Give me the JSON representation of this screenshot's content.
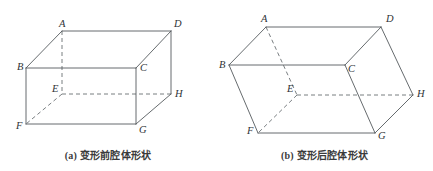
{
  "figure": {
    "background_color": "#ffffff",
    "line_color": "#555a5e",
    "hidden_line_color": "#6a6f73",
    "label_color": "#2f3336",
    "panels": [
      {
        "id": "panel-a",
        "caption": "(a) 变形前腔体形状",
        "caption_prefix": "(a)",
        "caption_text": "变形前腔体形状",
        "shape_name": "rectangular-cuboid-undeformed",
        "vertices": [
          {
            "label": "A",
            "x": 62,
            "y": 31,
            "label_x": 59,
            "label_y": 27,
            "hidden": false
          },
          {
            "label": "B",
            "x": 26,
            "y": 68,
            "label_x": 17,
            "label_y": 70,
            "hidden": false
          },
          {
            "label": "C",
            "x": 136,
            "y": 68,
            "label_x": 140,
            "label_y": 71,
            "hidden": false
          },
          {
            "label": "D",
            "x": 171,
            "y": 31,
            "label_x": 174,
            "label_y": 27,
            "hidden": false
          },
          {
            "label": "E",
            "x": 62,
            "y": 94,
            "label_x": 52,
            "label_y": 92,
            "hidden": true
          },
          {
            "label": "F",
            "x": 26,
            "y": 124,
            "label_x": 16,
            "label_y": 129,
            "hidden": false
          },
          {
            "label": "G",
            "x": 136,
            "y": 124,
            "label_x": 139,
            "label_y": 133,
            "hidden": false
          },
          {
            "label": "H",
            "x": 171,
            "y": 94,
            "label_x": 175,
            "label_y": 97,
            "hidden": false
          }
        ],
        "solid_edges": [
          [
            "A",
            "B"
          ],
          [
            "A",
            "D"
          ],
          [
            "B",
            "C"
          ],
          [
            "C",
            "D"
          ],
          [
            "B",
            "F"
          ],
          [
            "C",
            "G"
          ],
          [
            "D",
            "H"
          ],
          [
            "F",
            "G"
          ],
          [
            "G",
            "H"
          ]
        ],
        "hidden_edges": [
          [
            "A",
            "E"
          ],
          [
            "E",
            "F"
          ],
          [
            "E",
            "H"
          ]
        ]
      },
      {
        "id": "panel-b",
        "caption": "(b) 变形后腔体形状",
        "caption_prefix": "(b)",
        "caption_text": "变形后腔体形状",
        "shape_name": "parallelepiped-deformed",
        "vertices": [
          {
            "label": "A",
            "x": 266,
            "y": 27,
            "label_x": 261,
            "label_y": 22,
            "hidden": false
          },
          {
            "label": "B",
            "x": 229,
            "y": 65,
            "label_x": 219,
            "label_y": 68,
            "hidden": false
          },
          {
            "label": "C",
            "x": 345,
            "y": 65,
            "label_x": 348,
            "label_y": 72,
            "hidden": false
          },
          {
            "label": "D",
            "x": 381,
            "y": 27,
            "label_x": 386,
            "label_y": 22,
            "hidden": false
          },
          {
            "label": "E",
            "x": 297,
            "y": 95,
            "label_x": 287,
            "label_y": 92,
            "hidden": true
          },
          {
            "label": "F",
            "x": 258,
            "y": 133,
            "label_x": 247,
            "label_y": 134,
            "hidden": false
          },
          {
            "label": "G",
            "x": 375,
            "y": 133,
            "label_x": 378,
            "label_y": 139,
            "hidden": false
          },
          {
            "label": "H",
            "x": 413,
            "y": 95,
            "label_x": 417,
            "label_y": 97,
            "hidden": false
          }
        ],
        "solid_edges": [
          [
            "A",
            "B"
          ],
          [
            "A",
            "D"
          ],
          [
            "B",
            "C"
          ],
          [
            "C",
            "D"
          ],
          [
            "B",
            "F"
          ],
          [
            "C",
            "G"
          ],
          [
            "D",
            "H"
          ],
          [
            "F",
            "G"
          ],
          [
            "G",
            "H"
          ]
        ],
        "hidden_edges": [
          [
            "A",
            "E"
          ],
          [
            "E",
            "F"
          ],
          [
            "E",
            "H"
          ]
        ]
      }
    ]
  }
}
